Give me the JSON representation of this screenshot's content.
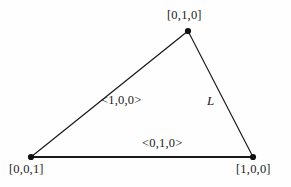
{
  "figure": {
    "background_color": "#fefefe",
    "line_color": "#1a1a1a",
    "text_color": "#1a1a1a"
  },
  "vertices": [
    {
      "id": "top",
      "label": "[0,1,0]",
      "x": 188,
      "y": 31
    },
    {
      "id": "bottom-left",
      "label": "[0,0,1]",
      "x": 31,
      "y": 157
    },
    {
      "id": "bottom-right",
      "label": "[1,0,0]",
      "x": 253,
      "y": 157
    }
  ],
  "edges": [
    {
      "id": "left",
      "label": "<1,0,0>",
      "from": "bottom-left",
      "to": "top"
    },
    {
      "id": "bottom",
      "label": "<0,1,0>",
      "from": "bottom-left",
      "to": "bottom-right"
    },
    {
      "id": "right",
      "label": "L",
      "from": "top",
      "to": "bottom-right"
    }
  ]
}
